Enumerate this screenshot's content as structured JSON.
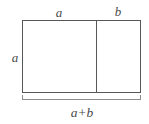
{
  "figure": {
    "type": "geometry-diagram",
    "background_color": "#ffffff",
    "line_color": "#585858",
    "text_color": "#4a4a4a",
    "labels": {
      "top_left_segment": "a",
      "top_right_segment": "b",
      "left_side": "a",
      "bottom_brace": "a+b"
    },
    "geometry": {
      "rect_left": 22,
      "rect_top": 20,
      "rect_right": 141,
      "rect_bottom": 93,
      "divider_x": 96,
      "brace_y": 99,
      "brace_left": 22,
      "brace_right": 141,
      "brace_tick_height": 5
    }
  }
}
